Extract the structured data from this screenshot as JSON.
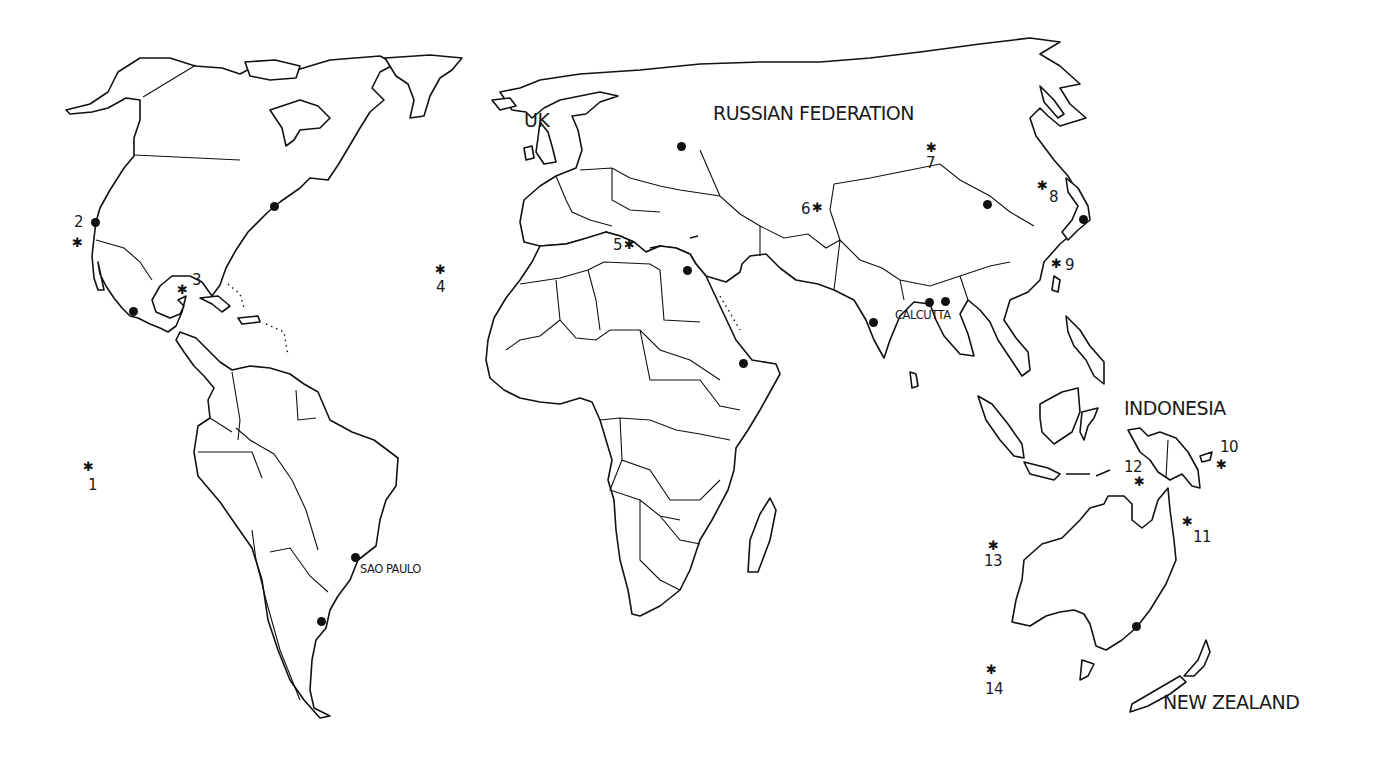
{
  "map": {
    "type": "outline world map with country borders",
    "colors": {
      "background": "#ffffff",
      "ink": "#111111"
    },
    "country_labels": [
      {
        "id": "uk",
        "text": "UK",
        "x": 524,
        "y": 111
      },
      {
        "id": "russia",
        "text": "RUSSIAN FEDERATION",
        "x": 713,
        "y": 104
      },
      {
        "id": "indonesia",
        "text": "INDONESIA",
        "x": 1124,
        "y": 399
      },
      {
        "id": "new-zealand",
        "text": "NEW ZEALAND",
        "x": 1163,
        "y": 693
      }
    ],
    "city_labels": [
      {
        "id": "calcutta",
        "text": "CALCUTTA",
        "x": 895,
        "y": 310
      },
      {
        "id": "sao-paulo",
        "text": "SAO PAULO",
        "x": 360,
        "y": 564
      }
    ],
    "city_dots": [
      {
        "id": "los-angeles",
        "x": 95,
        "y": 222
      },
      {
        "id": "new-york",
        "x": 274,
        "y": 206
      },
      {
        "id": "mexico-city",
        "x": 133,
        "y": 311
      },
      {
        "id": "sao-paulo",
        "x": 355,
        "y": 557
      },
      {
        "id": "buenos-aires",
        "x": 321,
        "y": 621
      },
      {
        "id": "moscow",
        "x": 681,
        "y": 146
      },
      {
        "id": "cairo",
        "x": 687,
        "y": 270
      },
      {
        "id": "djibouti",
        "x": 743,
        "y": 363
      },
      {
        "id": "bombay",
        "x": 873,
        "y": 322
      },
      {
        "id": "calcutta",
        "x": 929,
        "y": 302
      },
      {
        "id": "dhaka",
        "x": 945,
        "y": 301
      },
      {
        "id": "beijing",
        "x": 987,
        "y": 204
      },
      {
        "id": "tokyo",
        "x": 1083,
        "y": 219
      },
      {
        "id": "sydney",
        "x": 1136,
        "y": 626
      }
    ],
    "sites": [
      {
        "num": "1",
        "star_x": 89,
        "star_y": 467,
        "label_x": 88,
        "label_y": 478
      },
      {
        "num": "2",
        "star_x": 78,
        "star_y": 243,
        "label_x": 74,
        "label_y": 215
      },
      {
        "num": "3",
        "star_x": 183,
        "star_y": 290,
        "label_x": 192,
        "label_y": 273
      },
      {
        "num": "4",
        "star_x": 441,
        "star_y": 270,
        "label_x": 436,
        "label_y": 280
      },
      {
        "num": "5",
        "star_x": 630,
        "star_y": 245,
        "label_x": 613,
        "label_y": 238
      },
      {
        "num": "6",
        "star_x": 818,
        "star_y": 208,
        "label_x": 801,
        "label_y": 202
      },
      {
        "num": "7",
        "star_x": 932,
        "star_y": 148,
        "label_x": 926,
        "label_y": 156
      },
      {
        "num": "8",
        "star_x": 1043,
        "star_y": 186,
        "label_x": 1049,
        "label_y": 190
      },
      {
        "num": "9",
        "star_x": 1057,
        "star_y": 264,
        "label_x": 1065,
        "label_y": 258
      },
      {
        "num": "10",
        "star_x": 1222,
        "star_y": 465,
        "label_x": 1220,
        "label_y": 440
      },
      {
        "num": "11",
        "star_x": 1188,
        "star_y": 522,
        "label_x": 1193,
        "label_y": 530
      },
      {
        "num": "12",
        "star_x": 1140,
        "star_y": 482,
        "label_x": 1124,
        "label_y": 460
      },
      {
        "num": "13",
        "star_x": 994,
        "star_y": 546,
        "label_x": 984,
        "label_y": 554
      },
      {
        "num": "14",
        "star_x": 992,
        "star_y": 670,
        "label_x": 985,
        "label_y": 682
      }
    ],
    "marker_legend": {
      "star": "numbered site",
      "dot": "major city"
    }
  }
}
